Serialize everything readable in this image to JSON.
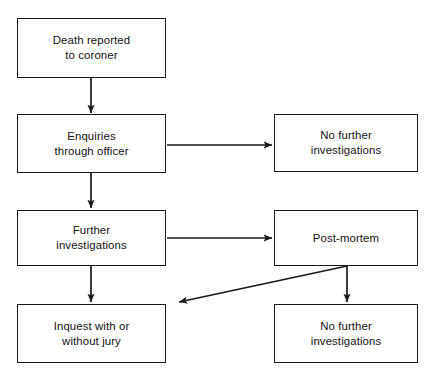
{
  "diagram": {
    "type": "flowchart",
    "orientation": "top-to-bottom",
    "background_color": "#ffffff",
    "line_color": "#1a1a1a",
    "text_color": "#111111",
    "nodes": [
      {
        "id": "death-reported",
        "label": "Death reported\nto coroner",
        "x": 17,
        "y": 18,
        "w": 149,
        "h": 60
      },
      {
        "id": "enquiries-through-officer",
        "label": "Enquiries\nthrough officer",
        "x": 17,
        "y": 114,
        "w": 149,
        "h": 59
      },
      {
        "id": "no-further-investigations-1",
        "label": "No further\ninvestigations",
        "x": 274,
        "y": 114,
        "w": 144,
        "h": 58
      },
      {
        "id": "further-investigations",
        "label": "Further\ninvestigations",
        "x": 17,
        "y": 210,
        "w": 149,
        "h": 56
      },
      {
        "id": "post-mortem",
        "label": "Post-mortem",
        "x": 274,
        "y": 210,
        "w": 144,
        "h": 56
      },
      {
        "id": "inquest-with-or-without-jury",
        "label": "Inquest with or\nwithout jury",
        "x": 17,
        "y": 304,
        "w": 149,
        "h": 59
      },
      {
        "id": "no-further-investigations-2",
        "label": "No further\ninvestigations",
        "x": 274,
        "y": 304,
        "w": 144,
        "h": 59
      }
    ],
    "edges": [
      {
        "id": "death-to-enquiries",
        "from": "death-reported",
        "to": "enquiries-through-officer",
        "kind": "vertical-arrow",
        "points": "91,78 91,113"
      },
      {
        "id": "enquiries-to-no-further-1",
        "from": "enquiries-through-officer",
        "to": "no-further-investigations-1",
        "kind": "horizontal-arrow",
        "points": "167,145 272,145"
      },
      {
        "id": "enquiries-to-further-investigations",
        "from": "enquiries-through-officer",
        "to": "further-investigations",
        "kind": "vertical-arrow",
        "points": "91,173 91,208"
      },
      {
        "id": "further-investigations-to-post-mortem",
        "from": "further-investigations",
        "to": "post-mortem",
        "kind": "horizontal-arrow",
        "points": "167,238 272,238"
      },
      {
        "id": "further-investigations-to-inquest",
        "from": "further-investigations",
        "to": "inquest-with-or-without-jury",
        "kind": "vertical-arrow",
        "points": "91,266 91,302"
      },
      {
        "id": "post-mortem-to-no-further-2",
        "from": "post-mortem",
        "to": "no-further-investigations-2",
        "kind": "vertical-arrow",
        "points": "347,266 347,302"
      },
      {
        "id": "post-mortem-to-inquest",
        "from": "post-mortem",
        "to": "inquest-with-or-without-jury",
        "kind": "diagonal-arrow",
        "points": "347,266 179,302"
      }
    ]
  }
}
